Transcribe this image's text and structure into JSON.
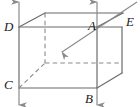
{
  "figure": {
    "type": "geometry-diagram",
    "width": 140,
    "height": 107,
    "background_color": "#ffffff",
    "line_color": "#6b6b6b",
    "label_color": "#1a1a1a",
    "labels": {
      "a": "A",
      "b": "B",
      "c": "C",
      "d": "D",
      "e": "E"
    },
    "label_positions": {
      "a": {
        "x": 88,
        "y": 30
      },
      "b": {
        "x": 85,
        "y": 103
      },
      "c": {
        "x": 4,
        "y": 89
      },
      "d": {
        "x": 4,
        "y": 31
      },
      "e": {
        "x": 126,
        "y": 26
      }
    },
    "vertices": {
      "front_top_left": {
        "x": 19,
        "y": 27
      },
      "front_top_right": {
        "x": 97,
        "y": 27
      },
      "front_bottom_left": {
        "x": 19,
        "y": 88
      },
      "front_bottom_right": {
        "x": 97,
        "y": 88
      },
      "back_top_left": {
        "x": 45,
        "y": 13
      },
      "back_top_right": {
        "x": 123,
        "y": 13
      },
      "back_bottom_left": {
        "x": 45,
        "y": 63
      },
      "back_bottom_right": {
        "x": 122,
        "y": 63
      },
      "right_top": {
        "x": 122,
        "y": 27
      },
      "right_bottom": {
        "x": 122,
        "y": 73
      }
    },
    "solid_edges": [
      {
        "name": "front-top-edge",
        "x1": 19,
        "y1": 27,
        "x2": 97,
        "y2": 27
      },
      {
        "name": "front-top-edge-right-extension",
        "x1": 97,
        "y1": 27,
        "x2": 122,
        "y2": 27
      },
      {
        "name": "front-left-vertical-edge",
        "x1": 19,
        "y1": 27,
        "x2": 19,
        "y2": 88
      },
      {
        "name": "front-bottom-edge",
        "x1": 19,
        "y1": 88,
        "x2": 97,
        "y2": 88
      },
      {
        "name": "front-right-vertical-edge",
        "x1": 97,
        "y1": 27,
        "x2": 97,
        "y2": 88
      },
      {
        "name": "top-back-edge",
        "x1": 45,
        "y1": 13,
        "x2": 123,
        "y2": 13
      },
      {
        "name": "top-left-slant-edge",
        "x1": 19,
        "y1": 27,
        "x2": 45,
        "y2": 13
      },
      {
        "name": "top-right-slant-edge",
        "x1": 97,
        "y1": 27,
        "x2": 123,
        "y2": 13
      },
      {
        "name": "right-vertical-edge",
        "x1": 122,
        "y1": 27,
        "x2": 122,
        "y2": 73
      },
      {
        "name": "bottom-right-slant-edge",
        "x1": 97,
        "y1": 88,
        "x2": 122,
        "y2": 73
      }
    ],
    "dashed_edges": [
      {
        "name": "hidden-back-left-vertical-edge",
        "x1": 45,
        "y1": 13,
        "x2": 45,
        "y2": 63
      },
      {
        "name": "hidden-back-bottom-edge",
        "x1": 45,
        "y1": 63,
        "x2": 122,
        "y2": 63
      },
      {
        "name": "hidden-bottom-left-slant-edge",
        "x1": 19,
        "y1": 88,
        "x2": 45,
        "y2": 63
      }
    ],
    "arrows": [
      {
        "name": "up-arrow-left",
        "direction": "up",
        "x1": 19,
        "y1": 27,
        "x2": 19,
        "y2": 2
      },
      {
        "name": "up-arrow-right",
        "direction": "up",
        "x1": 97,
        "y1": 27,
        "x2": 97,
        "y2": 2
      },
      {
        "name": "down-arrow-left",
        "direction": "down",
        "x1": 19,
        "y1": 88,
        "x2": 19,
        "y2": 105
      },
      {
        "name": "down-arrow-right",
        "direction": "down",
        "x1": 97,
        "y1": 88,
        "x2": 97,
        "y2": 105
      },
      {
        "name": "diagonal-arrow-into-box",
        "direction": "down-left",
        "x1": 137,
        "y1": 2,
        "x2": 62,
        "y2": 52
      }
    ]
  }
}
